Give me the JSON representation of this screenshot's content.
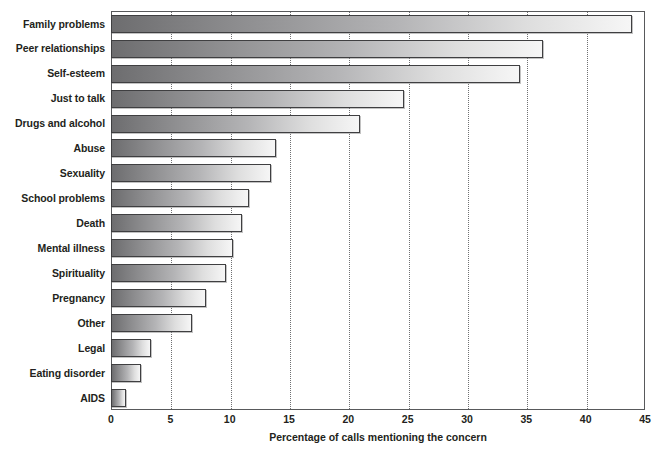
{
  "chart_data": {
    "type": "bar",
    "orientation": "horizontal",
    "title": "",
    "xlabel": "Percentage of calls mentioning the concern",
    "ylabel": "",
    "xlim": [
      0,
      45
    ],
    "xticks": [
      0,
      5,
      10,
      15,
      20,
      25,
      30,
      35,
      40,
      45
    ],
    "grid": "vertical-dotted",
    "legend": "none",
    "categories": [
      "Family problems",
      "Peer relationships",
      "Self-esteem",
      "Just to talk",
      "Drugs and alcohol",
      "Abuse",
      "Sexuality",
      "School problems",
      "Death",
      "Mental illness",
      "Spirituality",
      "Pregnancy",
      "Other",
      "Legal",
      "Eating disorder",
      "AIDS"
    ],
    "values": [
      43.9,
      36.4,
      34.5,
      24.7,
      21.0,
      13.9,
      13.5,
      11.6,
      11.0,
      10.3,
      9.7,
      8.0,
      6.8,
      3.4,
      2.5,
      1.3
    ],
    "bar_colors": {
      "gradient_start": "#6d6d6f",
      "gradient_end": "#f6f6f6",
      "border": "#3f3f41"
    },
    "axis_color": "#58595b",
    "grid_color": "#6f7072",
    "text_color": "#231f20"
  },
  "axis": {
    "x_title": "Percentage of calls mentioning the concern",
    "tick_labels": [
      "0",
      "5",
      "10",
      "15",
      "20",
      "25",
      "30",
      "35",
      "40",
      "45"
    ]
  }
}
